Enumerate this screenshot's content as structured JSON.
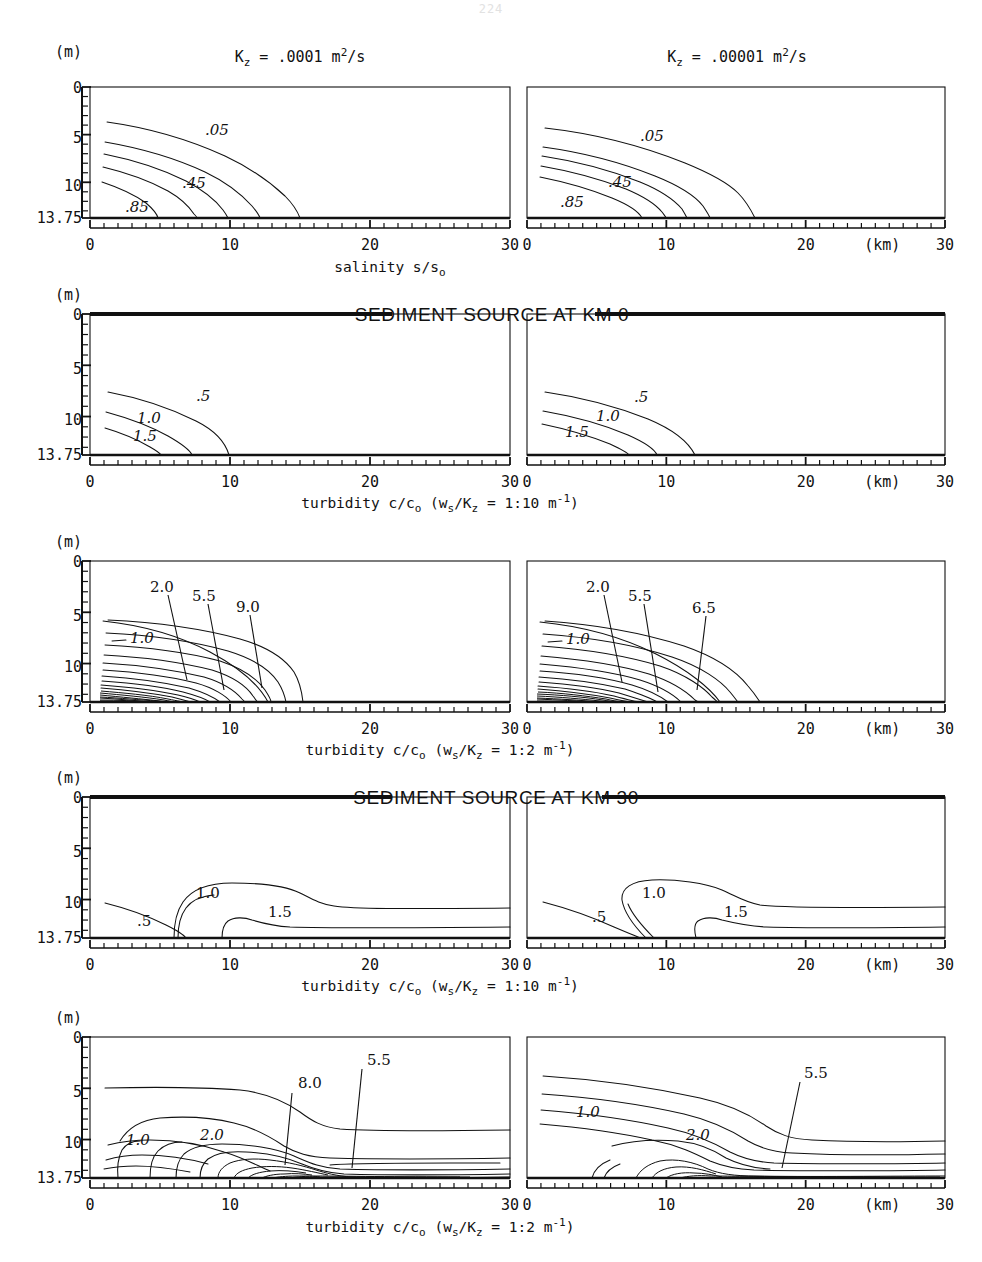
{
  "page": {
    "number": "224"
  },
  "figure": {
    "column_titles": [
      {
        "text": "K_z  =  .0001 m2/s",
        "kz": ".0001",
        "prefix": "K",
        "sub": "z",
        "eq": "=",
        "unit": "m",
        "exp": "2",
        "per": "/s"
      },
      {
        "text": "K_z  =  .00001 m2/s",
        "kz": ".00001"
      }
    ],
    "section_headings": [
      "SEDIMENT SOURCE AT KM 0",
      "SEDIMENT SOURCE AT KM 30"
    ],
    "row_captions": [
      "salinity s/s_o",
      "turbidity c/c_o  (w_s/K_z = 1:10 m^-1)",
      "turbidity c/c_o  (w_s/K_z = 1:2 m^-1)",
      "turbidity c/c_o  (w_s/K_z = 1:10 m^-1)",
      "turbidity c/c_o  (w_s/K_z = 1:2 m^-1)"
    ],
    "axes": {
      "y_unit": "(m)",
      "y_ticks": [
        "0",
        "5",
        "10",
        "13.75"
      ],
      "y_values": [
        0,
        5,
        10,
        13.75
      ],
      "y_range": [
        0,
        13.75
      ],
      "x_unit": "(km)",
      "x_ticks": [
        "0",
        "10",
        "20",
        "30"
      ],
      "x_values": [
        0,
        10,
        20,
        30
      ],
      "x_range": [
        0,
        30
      ],
      "x_minor_step": 1
    }
  },
  "chart_data": [
    {
      "id": "row1-left",
      "type": "contour",
      "title": "K_z = .0001 m2/s",
      "xlabel": "(km)",
      "ylabel": "(m)",
      "quantity": "salinity s/s_o",
      "xlim": [
        0,
        30
      ],
      "ylim": [
        13.75,
        0
      ],
      "grid": false,
      "legend": "none",
      "labeled_contours": [
        {
          "value": ".05",
          "x": 8.5,
          "y": 5.0
        },
        {
          "value": ".45",
          "x": 6.2,
          "y": 9.8
        },
        {
          "value": ".85",
          "x": 2.2,
          "y": 12.3
        }
      ],
      "n_contours": 5,
      "contour_values": [
        ".05",
        ".25",
        ".45",
        ".65",
        ".85"
      ],
      "notes": "Contours rise from bed near x=0 and plunge to bed between x=6 and x=16 km"
    },
    {
      "id": "row1-right",
      "type": "contour",
      "title": "K_z = .00001 m2/s",
      "xlabel": "(km)",
      "ylabel": "(m)",
      "quantity": "salinity s/s_o",
      "xlim": [
        0,
        30
      ],
      "ylim": [
        13.75,
        0
      ],
      "grid": false,
      "legend": "none",
      "labeled_contours": [
        {
          "value": ".05",
          "x": 8.5,
          "y": 5.2
        },
        {
          "value": ".45",
          "x": 5.6,
          "y": 9.7
        },
        {
          "value": ".85",
          "x": 2.3,
          "y": 12.1
        }
      ],
      "n_contours": 5,
      "contour_values": [
        ".05",
        ".25",
        ".45",
        ".65",
        ".85"
      ],
      "notes": "Contours extend farther seaward, reaching bed between x=13 and x=18.5 km"
    },
    {
      "id": "row2-left",
      "type": "contour",
      "title": "K_z = .0001 m2/s",
      "section": "SEDIMENT SOURCE AT KM 0",
      "quantity": "turbidity c/c_o (w_s/K_z = 1:10 m^-1)",
      "xlim": [
        0,
        30
      ],
      "ylim": [
        13.75,
        0
      ],
      "grid": false,
      "legend": "none",
      "labeled_contours": [
        {
          "value": ".5",
          "x": 5.4,
          "y": 8.1
        },
        {
          "value": "1.0",
          "x": 3.2,
          "y": 10.3
        },
        {
          "value": "1.5",
          "x": 3.1,
          "y": 12.0
        }
      ],
      "n_contours": 3,
      "contour_values": [
        ".5",
        "1.0",
        "1.5"
      ]
    },
    {
      "id": "row2-right",
      "type": "contour",
      "title": "K_z = .00001 m2/s",
      "section": "SEDIMENT SOURCE AT KM 0",
      "quantity": "turbidity c/c_o (w_s/K_z = 1:10 m^-1)",
      "xlim": [
        0,
        30
      ],
      "ylim": [
        13.75,
        0
      ],
      "grid": false,
      "legend": "none",
      "labeled_contours": [
        {
          "value": ".5",
          "x": 6.5,
          "y": 8.2
        },
        {
          "value": "1.0",
          "x": 4.6,
          "y": 10.1
        },
        {
          "value": "1.5",
          "x": 2.9,
          "y": 11.4
        }
      ],
      "n_contours": 3,
      "contour_values": [
        ".5",
        "1.0",
        "1.5"
      ]
    },
    {
      "id": "row3-left",
      "type": "contour",
      "title": "K_z = .0001 m2/s",
      "section": "SEDIMENT SOURCE AT KM 0",
      "quantity": "turbidity c/c_o (w_s/K_z = 1:2 m^-1)",
      "xlim": [
        0,
        30
      ],
      "ylim": [
        13.75,
        0
      ],
      "grid": false,
      "legend": "none",
      "labeled_contours": [
        {
          "value": "1.0",
          "x": 2.6,
          "y": 8.1,
          "leader": false
        },
        {
          "value": "2.0",
          "x": 5.0,
          "y": 4.1,
          "leader": true,
          "tip_x": 5.8,
          "tip_y": 11.6
        },
        {
          "value": "5.5",
          "x": 8.2,
          "y": 5.1,
          "leader": true,
          "tip_x": 9.4,
          "tip_y": 12.6
        },
        {
          "value": "9.0",
          "x": 11.2,
          "y": 6.2,
          "leader": true,
          "tip_x": 11.6,
          "tip_y": 12.3
        }
      ],
      "n_contours": 18,
      "notes": "Dense near-bed contour bundle between x=1.5 and x=16 km"
    },
    {
      "id": "row3-right",
      "type": "contour",
      "title": "K_z = .00001 m2/s",
      "section": "SEDIMENT SOURCE AT KM 0",
      "quantity": "turbidity c/c_o (w_s/K_z = 1:2 m^-1)",
      "xlim": [
        0,
        30
      ],
      "ylim": [
        13.75,
        0
      ],
      "grid": false,
      "legend": "none",
      "labeled_contours": [
        {
          "value": "1.0",
          "x": 2.3,
          "y": 8.3,
          "leader": false
        },
        {
          "value": "2.0",
          "x": 4.9,
          "y": 4.2,
          "leader": true,
          "tip_x": 5.6,
          "tip_y": 11.9
        },
        {
          "value": "5.5",
          "x": 7.9,
          "y": 5.3,
          "leader": true,
          "tip_x": 9.0,
          "tip_y": 12.8
        },
        {
          "value": "6.5",
          "x": 12.4,
          "y": 6.5,
          "leader": true,
          "tip_x": 12.0,
          "tip_y": 12.5
        }
      ],
      "n_contours": 18
    },
    {
      "id": "row4-left",
      "type": "contour",
      "title": "K_z = .0001 m2/s",
      "section": "SEDIMENT SOURCE AT KM 30",
      "quantity": "turbidity c/c_o (w_s/K_z = 1:10 m^-1)",
      "xlim": [
        0,
        30
      ],
      "ylim": [
        13.75,
        0
      ],
      "grid": false,
      "legend": "none",
      "labeled_contours": [
        {
          "value": ".5",
          "x": 2.0,
          "y": 12.2
        },
        {
          "value": "1.0",
          "x": 7.0,
          "y": 7.8
        },
        {
          "value": "1.5",
          "x": 13.0,
          "y": 10.1
        }
      ],
      "n_contours": 3,
      "contour_values": [
        ".5",
        "1.0",
        "1.5"
      ],
      "notes": "Contours extend horizontally from the KM 30 source toward lower km"
    },
    {
      "id": "row4-right",
      "type": "contour",
      "title": "K_z = .00001 m2/s",
      "section": "SEDIMENT SOURCE AT KM 30",
      "quantity": "turbidity c/c_o (w_s/K_z = 1:10 m^-1)",
      "xlim": [
        0,
        30
      ],
      "ylim": [
        13.75,
        0
      ],
      "grid": false,
      "legend": "none",
      "labeled_contours": [
        {
          "value": ".5",
          "x": 6.0,
          "y": 11.7
        },
        {
          "value": "1.0",
          "x": 9.6,
          "y": 7.8
        },
        {
          "value": "1.5",
          "x": 17.0,
          "y": 10.0
        }
      ],
      "n_contours": 3,
      "contour_values": [
        ".5",
        "1.0",
        "1.5"
      ]
    },
    {
      "id": "row5-left",
      "type": "contour",
      "title": "K_z = .0001 m2/s",
      "section": "SEDIMENT SOURCE AT KM 30",
      "quantity": "turbidity c/c_o (w_s/K_z = 1:2 m^-1)",
      "xlim": [
        0,
        30
      ],
      "ylim": [
        13.75,
        0
      ],
      "grid": false,
      "legend": "none",
      "labeled_contours": [
        {
          "value": "1.0",
          "x": 3.3,
          "y": 10.3,
          "leader": false
        },
        {
          "value": "2.0",
          "x": 8.6,
          "y": 9.8,
          "leader": false
        },
        {
          "value": "8.0",
          "x": 15.2,
          "y": 5.2,
          "leader": true,
          "tip_x": 13.9,
          "tip_y": 12.6
        },
        {
          "value": "5.5",
          "x": 20.3,
          "y": 3.6,
          "leader": true,
          "tip_x": 18.6,
          "tip_y": 12.6
        }
      ],
      "n_contours": 20
    },
    {
      "id": "row5-right",
      "type": "contour",
      "title": "K_z = .00001 m2/s",
      "section": "SEDIMENT SOURCE AT KM 30",
      "quantity": "turbidity c/c_o (w_s/K_z = 1:2 m^-1)",
      "xlim": [
        0,
        30
      ],
      "ylim": [
        13.75,
        0
      ],
      "grid": false,
      "legend": "none",
      "labeled_contours": [
        {
          "value": "1.0",
          "x": 3.4,
          "y": 9.0,
          "leader": false
        },
        {
          "value": "2.0",
          "x": 9.0,
          "y": 10.2,
          "leader": false
        },
        {
          "value": "5.5",
          "x": 14.8,
          "y": 4.4,
          "leader": true,
          "tip_x": 13.6,
          "tip_y": 12.6
        }
      ],
      "n_contours": 20
    }
  ]
}
